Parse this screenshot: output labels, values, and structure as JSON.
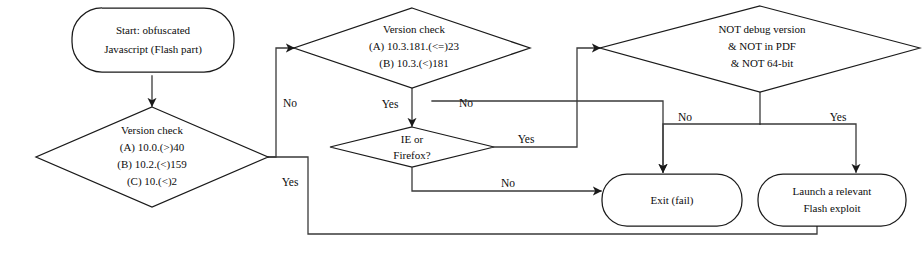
{
  "diagram": {
    "canvas": {
      "width": 922,
      "height": 254
    },
    "colors": {
      "background": "#ffffff",
      "stroke": "#1a1a1a",
      "edge": "#3a3a3a",
      "text": "#0d0d0d"
    },
    "nodes": [
      {
        "id": "start",
        "shape": "rounded-rectangle",
        "name": "start-node",
        "lines": [
          "Start: obfuscated",
          "Javascript (Flash part)"
        ]
      },
      {
        "id": "version-check-left",
        "shape": "diamond",
        "name": "version-check-left-node",
        "lines": [
          "Version check",
          "(A) 10.0.(>)40",
          "(B) 10.2.(<)159",
          "(C) 10.(<)2"
        ]
      },
      {
        "id": "version-check-mid",
        "shape": "diamond",
        "name": "version-check-mid-node",
        "lines": [
          "Version check",
          "(A) 10.3.181.(<=)23",
          "(B) 10.3.(<)181"
        ]
      },
      {
        "id": "browser-check",
        "shape": "diamond",
        "name": "browser-check-node",
        "lines": [
          "IE or",
          "Firefox?"
        ]
      },
      {
        "id": "environment-check",
        "shape": "diamond",
        "name": "environment-check-node",
        "lines": [
          "NOT debug version",
          "& NOT in PDF",
          "& NOT 64-bit"
        ]
      },
      {
        "id": "exit-fail",
        "shape": "rounded-rectangle",
        "name": "exit-fail-node",
        "lines": [
          "Exit (fail)"
        ]
      },
      {
        "id": "launch-exploit",
        "shape": "rounded-rectangle",
        "name": "launch-exploit-node",
        "lines": [
          "Launch a relevant",
          "Flash exploit"
        ]
      }
    ],
    "edge_labels": [
      {
        "id": "left-no",
        "text": "No",
        "from": "version-check-left",
        "to": "version-check-mid"
      },
      {
        "id": "left-yes",
        "text": "Yes",
        "from": "version-check-left",
        "to": "launch-exploit"
      },
      {
        "id": "mid-yes",
        "text": "Yes",
        "from": "version-check-mid",
        "to": "browser-check"
      },
      {
        "id": "mid-no",
        "text": "No",
        "from": "version-check-mid",
        "to": "exit-fail"
      },
      {
        "id": "browser-yes",
        "text": "Yes",
        "from": "browser-check",
        "to": "environment-check"
      },
      {
        "id": "browser-no",
        "text": "No",
        "from": "browser-check",
        "to": "exit-fail"
      },
      {
        "id": "env-no",
        "text": "No",
        "from": "environment-check",
        "to": "exit-fail"
      },
      {
        "id": "env-yes",
        "text": "Yes",
        "from": "environment-check",
        "to": "launch-exploit"
      }
    ]
  }
}
